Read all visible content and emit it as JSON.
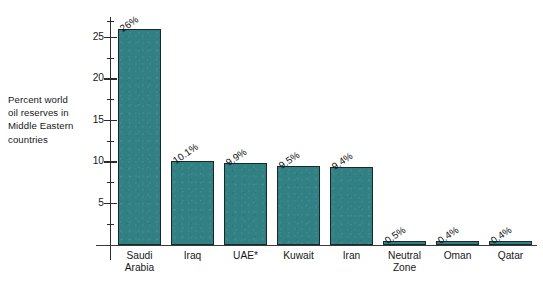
{
  "chart_data": {
    "type": "bar",
    "title": "",
    "subtitle": "",
    "xlabel": "",
    "ylabel": "Percent world\noil reserves in\nMiddle Eastern\ncountries",
    "categories": [
      "Saudi\nArabia",
      "Iraq",
      "UAE*",
      "Kuwait",
      "Iran",
      "Neutral\nZone",
      "Oman",
      "Qatar"
    ],
    "values": [
      26,
      10.1,
      9.9,
      9.5,
      9.4,
      0.5,
      0.4,
      0.4
    ],
    "value_labels": [
      "26%",
      "10.1%",
      "9.9%",
      "9.5%",
      "9.4%",
      "0.5%",
      "0.4%",
      "0.4%"
    ],
    "ylim": [
      0,
      27.5
    ],
    "y_major_ticks": [
      5,
      10,
      15,
      20,
      25
    ],
    "y_major_tick_labels": [
      "5",
      "10",
      "15",
      "20",
      "25"
    ],
    "y_minor_ticks": [
      2.5,
      7.5,
      12.5,
      17.5,
      22.5,
      27
    ],
    "grid": false,
    "legend": null,
    "bar_color": "#318083",
    "bar_edge_color": "#18282b",
    "axis_color": "#2b2b2b",
    "background": "#ffffff"
  }
}
